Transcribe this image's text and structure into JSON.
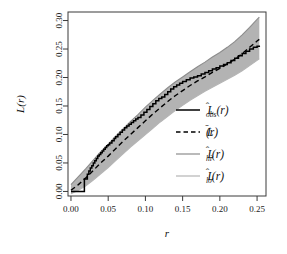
{
  "chart_data": {
    "type": "line",
    "title": "",
    "xlabel": "r",
    "ylabel": "L(r)",
    "xlim": [
      -0.004,
      0.262
    ],
    "ylim": [
      -0.008,
      0.315
    ],
    "xticks": [
      0.0,
      0.05,
      0.1,
      0.15,
      0.2,
      0.25
    ],
    "xticklabels": [
      "0.00",
      "0.05",
      "0.10",
      "0.15",
      "0.20",
      "0.25"
    ],
    "yticks": [
      0.0,
      0.05,
      0.1,
      0.15,
      0.2,
      0.25,
      0.3
    ],
    "yticklabels": [
      "0.00",
      "0.05",
      "0.10",
      "0.15",
      "0.20",
      "0.25",
      "0.30"
    ],
    "grid": false,
    "frame": true,
    "legend_position": "right-middle",
    "band_color": "#9a9a9a",
    "obs_color": "#000000",
    "mean_color": "#000000",
    "hi_color": "#8c8c8c",
    "lo_color": "#b5b5b5",
    "series": [
      {
        "name": "L_obs",
        "label": "L̂obs(r)",
        "style": "solid-step",
        "x": [
          0.0,
          0.012,
          0.018,
          0.018,
          0.022,
          0.024,
          0.026,
          0.028,
          0.03,
          0.032,
          0.034,
          0.036,
          0.038,
          0.04,
          0.042,
          0.044,
          0.046,
          0.048,
          0.05,
          0.052,
          0.055,
          0.058,
          0.06,
          0.063,
          0.066,
          0.069,
          0.072,
          0.075,
          0.078,
          0.081,
          0.084,
          0.087,
          0.09,
          0.094,
          0.098,
          0.102,
          0.106,
          0.11,
          0.114,
          0.118,
          0.122,
          0.126,
          0.13,
          0.134,
          0.138,
          0.142,
          0.146,
          0.15,
          0.155,
          0.16,
          0.165,
          0.17,
          0.175,
          0.18,
          0.185,
          0.19,
          0.195,
          0.2,
          0.205,
          0.21,
          0.215,
          0.22,
          0.225,
          0.23,
          0.235,
          0.24,
          0.245,
          0.25,
          0.253
        ],
        "y": [
          0.0,
          0.0,
          0.0,
          0.022,
          0.03,
          0.036,
          0.041,
          0.045,
          0.05,
          0.054,
          0.058,
          0.062,
          0.065,
          0.068,
          0.071,
          0.074,
          0.077,
          0.08,
          0.082,
          0.085,
          0.089,
          0.093,
          0.096,
          0.1,
          0.104,
          0.108,
          0.112,
          0.115,
          0.118,
          0.121,
          0.124,
          0.127,
          0.13,
          0.134,
          0.139,
          0.144,
          0.149,
          0.154,
          0.159,
          0.163,
          0.166,
          0.17,
          0.175,
          0.18,
          0.184,
          0.187,
          0.19,
          0.193,
          0.196,
          0.199,
          0.201,
          0.203,
          0.206,
          0.209,
          0.212,
          0.215,
          0.217,
          0.22,
          0.223,
          0.226,
          0.23,
          0.234,
          0.238,
          0.242,
          0.246,
          0.25,
          0.253,
          0.255,
          0.256
        ]
      },
      {
        "name": "L_mean",
        "label": "L̄(r)",
        "style": "dashed",
        "x": [
          0.0,
          0.01,
          0.02,
          0.03,
          0.04,
          0.05,
          0.06,
          0.07,
          0.08,
          0.09,
          0.1,
          0.11,
          0.12,
          0.13,
          0.14,
          0.15,
          0.16,
          0.17,
          0.18,
          0.19,
          0.2,
          0.21,
          0.22,
          0.23,
          0.24,
          0.25,
          0.253
        ],
        "y": [
          0.002,
          0.012,
          0.024,
          0.037,
          0.05,
          0.062,
          0.075,
          0.088,
          0.1,
          0.112,
          0.124,
          0.136,
          0.147,
          0.158,
          0.168,
          0.177,
          0.186,
          0.194,
          0.201,
          0.209,
          0.216,
          0.224,
          0.232,
          0.242,
          0.253,
          0.264,
          0.267
        ]
      },
      {
        "name": "L_hi",
        "label": "L̂hi(r)",
        "style": "solid-gray",
        "x": [
          0.0,
          0.01,
          0.02,
          0.03,
          0.04,
          0.05,
          0.06,
          0.07,
          0.08,
          0.09,
          0.1,
          0.11,
          0.12,
          0.13,
          0.14,
          0.15,
          0.16,
          0.17,
          0.18,
          0.19,
          0.2,
          0.21,
          0.22,
          0.23,
          0.24,
          0.25,
          0.253
        ],
        "y": [
          0.012,
          0.026,
          0.04,
          0.055,
          0.07,
          0.083,
          0.097,
          0.11,
          0.123,
          0.135,
          0.148,
          0.16,
          0.171,
          0.182,
          0.192,
          0.201,
          0.21,
          0.219,
          0.227,
          0.236,
          0.244,
          0.253,
          0.263,
          0.275,
          0.288,
          0.302,
          0.306
        ]
      },
      {
        "name": "L_lo",
        "label": "L̂lo(r)",
        "style": "solid-lightgray",
        "x": [
          0.0,
          0.01,
          0.02,
          0.03,
          0.04,
          0.05,
          0.06,
          0.07,
          0.08,
          0.09,
          0.1,
          0.11,
          0.12,
          0.13,
          0.14,
          0.15,
          0.16,
          0.17,
          0.18,
          0.19,
          0.2,
          0.21,
          0.22,
          0.23,
          0.24,
          0.25,
          0.253
        ],
        "y": [
          -0.004,
          0.002,
          0.01,
          0.02,
          0.031,
          0.042,
          0.054,
          0.066,
          0.078,
          0.089,
          0.1,
          0.111,
          0.122,
          0.132,
          0.142,
          0.151,
          0.16,
          0.168,
          0.176,
          0.183,
          0.19,
          0.197,
          0.204,
          0.212,
          0.221,
          0.23,
          0.233
        ]
      }
    ],
    "legend": [
      {
        "label_base": "L",
        "hat": "̂",
        "sub": "obs",
        "arg": "(r)",
        "style": "solid-black"
      },
      {
        "label_base": "L",
        "hat": "̄",
        "sub": "",
        "arg": "(r)",
        "style": "dashed-black"
      },
      {
        "label_base": "L",
        "hat": "̂",
        "sub": "hi",
        "arg": "(r)",
        "style": "solid-gray"
      },
      {
        "label_base": "L",
        "hat": "̂",
        "sub": "lo",
        "arg": "(r)",
        "style": "solid-lightgray"
      }
    ]
  }
}
